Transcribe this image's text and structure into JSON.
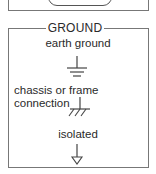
{
  "section": {
    "title": "GROUND"
  },
  "items": [
    {
      "label": "earth ground",
      "icon": "earth-ground-icon"
    },
    {
      "label_line1": "chassis or frame",
      "label_line2": "connection",
      "icon": "chassis-ground-icon"
    },
    {
      "label": "isolated",
      "icon": "isolated-ground-icon"
    }
  ],
  "colors": {
    "line": "#555555",
    "text": "#2a2a2a",
    "background": "#ffffff"
  }
}
